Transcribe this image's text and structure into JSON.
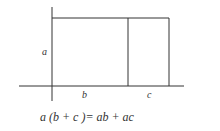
{
  "diagram": {
    "labels": {
      "side_a": "a",
      "segment_b": "b",
      "segment_c": "c"
    },
    "equation": "a (b + c )= ab + ac",
    "line_color": "#333333",
    "background": "#ffffff"
  }
}
